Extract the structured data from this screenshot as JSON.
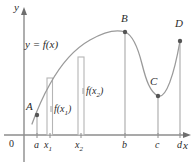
{
  "figure": {
    "colors": {
      "axis": "#8c8c8c",
      "curve": "#9a9a9a",
      "rect": "#b5b5b5",
      "drop_line": "#b0b0b0",
      "point": "#555555",
      "text": "#2b2b2b",
      "background": "#ffffff"
    },
    "axes": {
      "y_label": "y",
      "x_label": "x",
      "origin_label": "0"
    },
    "curve_label": "y = f(x)",
    "points": [
      {
        "name": "A",
        "label": "A",
        "x": 37,
        "y": 115
      },
      {
        "name": "B",
        "label": "B",
        "x": 125,
        "y": 32
      },
      {
        "name": "C",
        "label": "C",
        "x": 158,
        "y": 96
      },
      {
        "name": "D",
        "label": "D",
        "x": 180,
        "y": 41
      }
    ],
    "x_ticks": [
      {
        "label": "a",
        "sub": "",
        "x": 37
      },
      {
        "label": "x",
        "sub": "1",
        "x": 50
      },
      {
        "label": "x",
        "sub": "2",
        "x": 81
      },
      {
        "label": "b",
        "sub": "",
        "x": 125
      },
      {
        "label": "c",
        "sub": "",
        "x": 158
      },
      {
        "label": "d",
        "sub": "",
        "x": 180
      }
    ],
    "value_labels": [
      {
        "label": "f(x",
        "sub": "1",
        "tail": ")",
        "x": 52,
        "y": 110
      },
      {
        "label": "f(x",
        "sub": "2",
        "tail": ")",
        "x": 84,
        "y": 92
      }
    ],
    "rectangles": [
      {
        "name": "rect-x1",
        "left": 47,
        "right": 52,
        "top": 78,
        "bottom": 135
      },
      {
        "name": "rect-x2",
        "left": 78,
        "right": 84,
        "top": 57,
        "bottom": 135
      }
    ]
  }
}
